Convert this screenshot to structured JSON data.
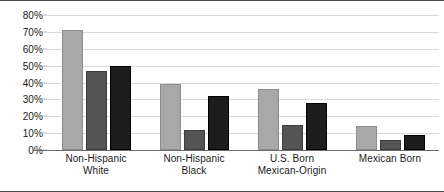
{
  "chart_data": {
    "type": "bar",
    "title": "",
    "subtitle": "",
    "xlabel": "",
    "ylabel": "",
    "ylim": [
      0,
      80
    ],
    "ytick_labels": [
      "0%",
      "10%",
      "20%",
      "30%",
      "40%",
      "50%",
      "60%",
      "70%",
      "80%"
    ],
    "ytick_values": [
      0,
      10,
      20,
      30,
      40,
      50,
      60,
      70,
      80
    ],
    "grid": true,
    "legend": "none",
    "categories": [
      "Non-Hispanic\nWhite",
      "Non-Hispanic\nBlack",
      "U.S. Born\nMexican-Origin",
      "Mexican Born"
    ],
    "series": [
      {
        "name": "series-1",
        "color": "#a8a8a8",
        "values": [
          71,
          39,
          36,
          14
        ]
      },
      {
        "name": "series-2",
        "color": "#545454",
        "values": [
          47,
          12,
          15,
          6
        ]
      },
      {
        "name": "series-3",
        "color": "#1c1c1c",
        "values": [
          50,
          32,
          28,
          9
        ]
      }
    ],
    "colors": {
      "series_light": "#a8a8a8",
      "series_medium": "#545454",
      "series_dark": "#1c1c1c",
      "gridline": "#d9d9d9",
      "axis": "#6b6b6b",
      "text": "#1a1a1a",
      "background": "#ffffff"
    }
  }
}
